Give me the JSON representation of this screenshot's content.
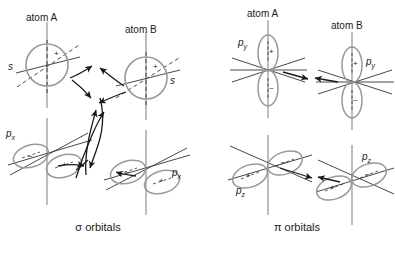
{
  "figure": {
    "title_hidden": "",
    "background_color": "#ffffff",
    "orbital_stroke_color": "#999999",
    "axis_stroke_color": "#333333",
    "arrow_color": "#1a1a1a",
    "panels": [
      {
        "id": "sigma",
        "caption": "σ orbitals",
        "atoms": [
          {
            "name": "atom A",
            "orbitals": [
              "s",
              "pₓ"
            ]
          },
          {
            "name": "atom B",
            "orbitals": [
              "s",
              "pₓ"
            ]
          }
        ]
      },
      {
        "id": "pi",
        "caption": "π orbitals",
        "atoms": [
          {
            "name": "atom A",
            "orbitals": [
              "p_y",
              "p_z"
            ]
          },
          {
            "name": "atom B",
            "orbitals": [
              "p_y",
              "p_z"
            ]
          }
        ]
      }
    ]
  },
  "labels": {
    "sigma_atom_a": "atom A",
    "sigma_atom_b": "atom B",
    "sigma_s_left": "s",
    "sigma_s_right": "s",
    "sigma_px_left": "p",
    "sigma_px_left_sub": "x",
    "sigma_px_right": "p",
    "sigma_px_right_sub": "x",
    "sigma_caption": "σ orbitals",
    "pi_atom_a": "atom A",
    "pi_atom_b": "atom B",
    "pi_py_left": "p",
    "pi_py_left_sub": "y",
    "pi_py_right": "p",
    "pi_py_right_sub": "y",
    "pi_pz_left": "p",
    "pi_pz_left_sub": "z",
    "pi_pz_right": "p",
    "pi_pz_right_sub": "z",
    "pi_caption": "π orbitals"
  },
  "signs": {
    "plus": "+",
    "minus": "–",
    "sigma_s_left_sign": "+",
    "sigma_s_right_sign": "+",
    "sigma_px_left_neg": "–",
    "sigma_px_left_pos": "+",
    "sigma_px_right_neg": "–",
    "sigma_px_right_pos": "+",
    "pi_py_left_top": "+",
    "pi_py_left_bottom": "–",
    "pi_py_right_top": "+",
    "pi_py_right_bottom": "–",
    "pi_pz_left_pos": "+",
    "pi_pz_left_neg": "–",
    "pi_pz_right_pos": "+",
    "pi_pz_right_neg": "–"
  }
}
